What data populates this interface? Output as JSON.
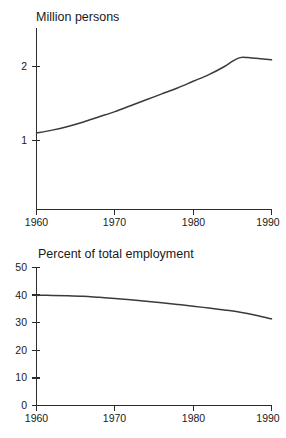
{
  "figure": {
    "background_color": "#ffffff",
    "line_color": "#3a3a3a",
    "axis_color": "#2b2b2b"
  },
  "chart_data": [
    {
      "type": "line",
      "title": "Million persons",
      "xlabel": "",
      "ylabel": "",
      "xlim": [
        1960,
        1990
      ],
      "ylim": [
        0,
        2.45
      ],
      "xticks": [
        1960,
        1970,
        1980,
        1990
      ],
      "xtick_labels": [
        "1960",
        "1970",
        "1980",
        "1990"
      ],
      "yticks": [
        1,
        2
      ],
      "ytick_labels": [
        "1",
        "2"
      ],
      "grid": false,
      "legend": "none",
      "x": [
        1960,
        1962,
        1964,
        1966,
        1968,
        1970,
        1972,
        1974,
        1976,
        1978,
        1980,
        1982,
        1984,
        1985,
        1986,
        1987,
        1988,
        1990
      ],
      "values": [
        1.1,
        1.14,
        1.19,
        1.25,
        1.32,
        1.39,
        1.47,
        1.55,
        1.63,
        1.71,
        1.8,
        1.89,
        2.0,
        2.07,
        2.12,
        2.12,
        2.11,
        2.09
      ]
    },
    {
      "type": "line",
      "title": "Percent of total employment",
      "xlabel": "",
      "ylabel": "",
      "xlim": [
        1960,
        1990
      ],
      "ylim": [
        0,
        50
      ],
      "xticks": [
        1960,
        1970,
        1980,
        1990
      ],
      "xtick_labels": [
        "1960",
        "1970",
        "1980",
        "1990"
      ],
      "yticks": [
        0,
        10,
        20,
        30,
        40,
        50
      ],
      "ytick_labels": [
        "0",
        "10",
        "20",
        "30",
        "40",
        "50"
      ],
      "grid": false,
      "legend": "none",
      "x": [
        1960,
        1962,
        1964,
        1966,
        1968,
        1970,
        1972,
        1974,
        1976,
        1978,
        1980,
        1982,
        1984,
        1986,
        1988,
        1990
      ],
      "values": [
        39.9,
        39.9,
        39.8,
        39.6,
        39.2,
        38.8,
        38.3,
        37.8,
        37.2,
        36.6,
        36.0,
        35.3,
        34.6,
        33.8,
        32.7,
        31.4
      ]
    }
  ],
  "top_chart": {
    "title": "Million persons",
    "ytick_1": "1",
    "ytick_2": "2",
    "xtick_1960": "1960",
    "xtick_1970": "1970",
    "xtick_1980": "1980",
    "xtick_1990": "1990"
  },
  "bottom_chart": {
    "title": "Percent of total employment",
    "ytick_0": "0",
    "ytick_10": "10",
    "ytick_20": "20",
    "ytick_30": "30",
    "ytick_40": "40",
    "ytick_50": "50",
    "xtick_1960": "1960",
    "xtick_1970": "1970",
    "xtick_1980": "1980",
    "xtick_1990": "1990"
  }
}
